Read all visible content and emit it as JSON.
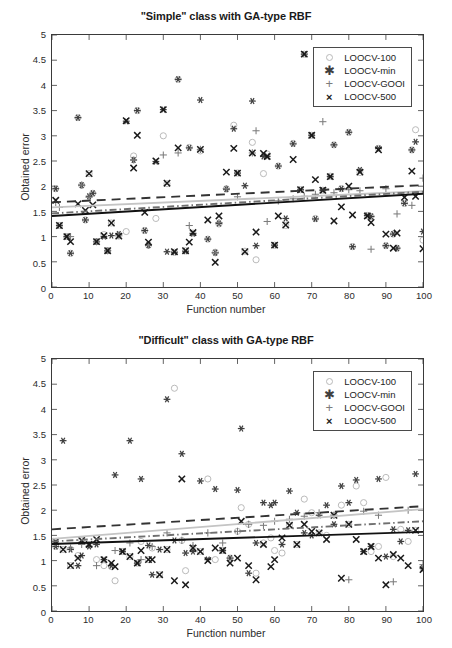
{
  "figure": {
    "background": "#ffffff",
    "width": 452,
    "height": 648
  },
  "axis_common": {
    "xlabel": "Function number",
    "ylabel": "Obtained error",
    "xticks": [
      "0",
      "10",
      "20",
      "30",
      "40",
      "50",
      "60",
      "70",
      "80",
      "90",
      "100"
    ],
    "yticks": [
      "0",
      "0.5",
      "1",
      "1.5",
      "2",
      "2.5",
      "3",
      "3.5",
      "4",
      "4.5",
      "5"
    ],
    "xlim": [
      0,
      100
    ],
    "ylim": [
      0,
      5
    ],
    "grid": false
  },
  "legend": {
    "position": "top-right",
    "entries": [
      {
        "label": "LOOCV-100",
        "marker": "circle-icon",
        "color": "#b9b9b9"
      },
      {
        "label": "LOOCV-min",
        "marker": "asterisk-icon",
        "color": "#3f3f3f"
      },
      {
        "label": "LOOCV-GOOI",
        "marker": "plus-icon",
        "color": "#7c7c7c"
      },
      {
        "label": "LOOCV-500",
        "marker": "cross-icon",
        "color": "#1a1a1a"
      }
    ]
  },
  "chart_data": [
    {
      "id": "simple-class",
      "type": "scatter",
      "title": "\"Simple\" class with GA-type RBF",
      "xlabel": "Function number",
      "ylabel": "Obtained error",
      "xlim": [
        0,
        100
      ],
      "ylim": [
        0,
        5
      ],
      "grid": false,
      "legend_position": "top-right",
      "series": [
        {
          "name": "LOOCV-100",
          "marker": "circle",
          "color": "#b9b9b9",
          "x": [
            1,
            2,
            4,
            5,
            7,
            8,
            9,
            10,
            11,
            12,
            14,
            15,
            16,
            18,
            20,
            22,
            23,
            25,
            26,
            28,
            30,
            31,
            33,
            34,
            36,
            37,
            38,
            40,
            42,
            44,
            45,
            47,
            49,
            50,
            52,
            54,
            55,
            57,
            58,
            60,
            61,
            63,
            65,
            67,
            68,
            70,
            71,
            73,
            75,
            76,
            78,
            80,
            81,
            83,
            85,
            86,
            88,
            90,
            92,
            93,
            95,
            97,
            98,
            100
          ],
          "y": [
            1.95,
            1.22,
            1.0,
            0.67,
            3.36,
            2.02,
            1.33,
            2.25,
            1.86,
            0.9,
            1.04,
            0.72,
            1.27,
            1.01,
            1.1,
            2.6,
            3.5,
            1.12,
            0.83,
            1.36,
            3.0,
            2.05,
            0.69,
            4.12,
            0.72,
            2.77,
            1.07,
            2.7,
            0.95,
            0.69,
            1.25,
            1.95,
            3.21,
            2.26,
            0.71,
            2.87,
            0.54,
            2.25,
            2.64,
            0.83,
            2.4,
            1.22,
            2.85,
            1.93,
            4.62,
            3.01,
            1.36,
            1.92,
            2.2,
            2.82,
            1.95,
            3.07,
            0.8,
            2.27,
            1.42,
            1.4,
            2.75,
            0.82,
            1.05,
            0.77,
            1.66,
            2.72,
            3.12,
            0.93
          ]
        },
        {
          "name": "LOOCV-min",
          "marker": "asterisk",
          "color": "#3f3f3f",
          "x": [
            1,
            2,
            4,
            5,
            7,
            8,
            9,
            10,
            11,
            12,
            14,
            15,
            16,
            18,
            20,
            22,
            23,
            25,
            26,
            28,
            30,
            31,
            33,
            34,
            36,
            37,
            38,
            40,
            42,
            44,
            45,
            47,
            49,
            50,
            52,
            54,
            55,
            57,
            58,
            60,
            61,
            63,
            65,
            67,
            68,
            70,
            71,
            73,
            75,
            76,
            78,
            80,
            81,
            83,
            85,
            86,
            88,
            90,
            92,
            93,
            95,
            97,
            98,
            100
          ],
          "y": [
            1.95,
            1.22,
            1.0,
            0.67,
            3.36,
            2.02,
            1.33,
            1.8,
            1.86,
            0.9,
            1.0,
            0.72,
            1.02,
            1.05,
            3.29,
            2.52,
            3.5,
            1.12,
            0.83,
            2.49,
            3.52,
            0.7,
            0.69,
            4.12,
            0.71,
            2.76,
            1.06,
            3.71,
            0.95,
            0.68,
            1.26,
            1.94,
            3.14,
            2.26,
            2.01,
            3.69,
            0.82,
            2.59,
            2.59,
            0.83,
            2.4,
            1.36,
            2.84,
            1.93,
            4.62,
            3.01,
            1.35,
            1.92,
            2.19,
            2.82,
            1.95,
            3.07,
            0.8,
            2.32,
            1.42,
            1.4,
            2.75,
            0.82,
            1.05,
            0.77,
            1.66,
            2.72,
            2.88,
            1.1
          ]
        },
        {
          "name": "LOOCV-GOOI",
          "marker": "plus",
          "color": "#7c7c7c",
          "x": [
            1,
            2,
            5,
            8,
            10,
            12,
            15,
            18,
            22,
            26,
            30,
            34,
            37,
            40,
            44,
            45,
            47,
            50,
            54,
            55,
            58,
            61,
            65,
            68,
            71,
            73,
            76,
            80,
            83,
            86,
            90,
            93,
            97,
            100
          ],
          "y": [
            1.68,
            1.58,
            1.0,
            2.02,
            1.78,
            0.9,
            0.72,
            1.03,
            2.52,
            0.83,
            2.62,
            2.66,
            1.22,
            2.73,
            0.68,
            1.28,
            1.95,
            1.79,
            2.66,
            3.1,
            1.3,
            1.71,
            1.75,
            1.8,
            1.84,
            3.28,
            1.87,
            1.93,
            1.91,
            0.75,
            1.95,
            1.45,
            1.62,
            2.16
          ]
        },
        {
          "name": "LOOCV-500",
          "marker": "cross",
          "color": "#1a1a1a",
          "x": [
            1,
            2,
            4,
            5,
            7,
            9,
            10,
            11,
            12,
            14,
            15,
            16,
            18,
            20,
            22,
            23,
            25,
            26,
            28,
            30,
            31,
            33,
            34,
            36,
            37,
            38,
            40,
            42,
            44,
            45,
            47,
            49,
            50,
            52,
            54,
            55,
            57,
            58,
            60,
            61,
            63,
            65,
            67,
            68,
            70,
            71,
            73,
            75,
            76,
            78,
            80,
            81,
            83,
            85,
            86,
            88,
            90,
            92,
            93,
            95,
            97,
            98,
            100
          ],
          "y": [
            1.72,
            1.22,
            1.0,
            0.9,
            1.65,
            1.52,
            2.25,
            1.63,
            0.9,
            1.02,
            0.72,
            1.27,
            1.01,
            3.3,
            2.36,
            3.01,
            1.48,
            0.89,
            2.5,
            3.52,
            2.06,
            0.7,
            2.76,
            0.72,
            0.89,
            1.08,
            2.73,
            1.33,
            0.49,
            1.41,
            2.28,
            2.75,
            2.26,
            0.7,
            2.66,
            1.09,
            2.65,
            2.59,
            0.83,
            1.41,
            1.23,
            2.53,
            1.93,
            4.62,
            3.01,
            2.13,
            1.92,
            2.19,
            1.31,
            1.59,
            2.0,
            1.43,
            2.28,
            1.41,
            1.28,
            2.72,
            1.05,
            0.77,
            1.07,
            1.78,
            2.3,
            1.8,
            0.76
          ]
        }
      ],
      "trend_lines": [
        {
          "name": "LOOCV-min-fit",
          "style": "dashed",
          "color": "#333333",
          "y_start": 1.68,
          "y_end": 2.02
        },
        {
          "name": "LOOCV-100-fit",
          "style": "solid",
          "color": "#c4c4c4",
          "y_start": 1.58,
          "y_end": 1.9
        },
        {
          "name": "LOOCV-GOOI-fit",
          "style": "dashdot",
          "color": "#6f6f6f",
          "y_start": 1.46,
          "y_end": 1.89
        },
        {
          "name": "LOOCV-500-fit",
          "style": "solid",
          "color": "#111111",
          "y_start": 1.41,
          "y_end": 1.85
        }
      ]
    },
    {
      "id": "difficult-class",
      "type": "scatter",
      "title": "\"Difficult\" class with GA-type RBF",
      "xlabel": "Function number",
      "ylabel": "Obtained error",
      "xlim": [
        0,
        100
      ],
      "ylim": [
        0,
        5
      ],
      "grid": false,
      "legend_position": "top-right",
      "series": [
        {
          "name": "LOOCV-100",
          "marker": "circle",
          "color": "#b9b9b9",
          "x": [
            1,
            3,
            5,
            7,
            8,
            10,
            12,
            14,
            16,
            17,
            19,
            21,
            23,
            24,
            26,
            27,
            29,
            31,
            33,
            35,
            36,
            38,
            40,
            42,
            44,
            46,
            48,
            50,
            51,
            53,
            55,
            57,
            59,
            60,
            62,
            64,
            66,
            68,
            70,
            72,
            74,
            76,
            78,
            80,
            82,
            84,
            86,
            88,
            90,
            92,
            94,
            96,
            98,
            100
          ],
          "y": [
            1.28,
            1.22,
            0.9,
            1.1,
            1.4,
            1.32,
            1.02,
            0.9,
            0.88,
            0.6,
            1.18,
            1.08,
            0.95,
            1.38,
            1.02,
            1.25,
            0.72,
            1.22,
            4.42,
            1.4,
            0.8,
            1.25,
            1.18,
            2.62,
            1.02,
            1.2,
            1.05,
            1.58,
            2.05,
            1.72,
            0.75,
            1.35,
            1.45,
            1.2,
            1.15,
            1.7,
            1.32,
            2.22,
            1.95,
            1.55,
            1.5,
            1.9,
            2.1,
            1.72,
            2.48,
            2.15,
            1.18,
            1.28,
            2.65,
            1.08,
            1.62,
            1.38,
            1.6,
            0.85
          ]
        },
        {
          "name": "LOOCV-min",
          "marker": "asterisk",
          "color": "#3f3f3f",
          "x": [
            1,
            3,
            5,
            7,
            8,
            10,
            12,
            14,
            16,
            17,
            19,
            21,
            23,
            24,
            26,
            27,
            29,
            31,
            33,
            35,
            36,
            38,
            40,
            42,
            44,
            46,
            48,
            50,
            51,
            53,
            55,
            57,
            59,
            60,
            62,
            64,
            66,
            68,
            70,
            72,
            74,
            76,
            78,
            80,
            82,
            84,
            86,
            88,
            90,
            92,
            94,
            96,
            98,
            100
          ],
          "y": [
            1.28,
            3.38,
            1.22,
            0.9,
            1.1,
            1.28,
            1.32,
            1.02,
            0.9,
            2.7,
            1.18,
            3.38,
            0.95,
            2.62,
            1.3,
            0.72,
            1.22,
            4.2,
            1.4,
            3.12,
            1.15,
            1.18,
            2.58,
            1.02,
            2.42,
            1.2,
            1.05,
            2.4,
            3.62,
            0.75,
            1.35,
            2.15,
            2.1,
            2.15,
            1.32,
            2.38,
            1.95,
            1.55,
            1.5,
            1.9,
            2.1,
            1.72,
            2.48,
            2.15,
            2.6,
            1.18,
            1.28,
            2.62,
            1.08,
            1.62,
            1.38,
            1.6,
            2.72,
            0.85
          ]
        },
        {
          "name": "LOOCV-GOOI",
          "marker": "plus",
          "color": "#7c7c7c",
          "x": [
            1,
            5,
            8,
            12,
            17,
            21,
            24,
            27,
            31,
            35,
            38,
            42,
            46,
            50,
            53,
            57,
            60,
            64,
            68,
            72,
            76,
            80,
            84,
            88,
            92,
            96,
            100
          ],
          "y": [
            1.35,
            1.25,
            1.32,
            0.9,
            1.2,
            1.35,
            1.02,
            1.28,
            1.55,
            1.4,
            1.3,
            1.55,
            1.35,
            1.58,
            1.72,
            1.7,
            1.78,
            1.82,
            1.88,
            1.95,
            1.9,
            0.62,
            1.98,
            1.9,
            0.58,
            2.0,
            0.92
          ]
        },
        {
          "name": "LOOCV-500",
          "marker": "cross",
          "color": "#1a1a1a",
          "x": [
            1,
            3,
            5,
            7,
            8,
            10,
            12,
            14,
            16,
            17,
            19,
            21,
            23,
            24,
            26,
            27,
            29,
            31,
            33,
            35,
            36,
            38,
            40,
            42,
            44,
            46,
            48,
            50,
            51,
            53,
            55,
            57,
            59,
            60,
            62,
            64,
            66,
            68,
            70,
            72,
            74,
            76,
            78,
            80,
            82,
            84,
            86,
            88,
            90,
            92,
            94,
            96,
            98,
            100
          ],
          "y": [
            1.38,
            1.22,
            0.9,
            1.05,
            1.4,
            1.32,
            1.42,
            1.02,
            0.95,
            0.88,
            1.18,
            1.08,
            0.95,
            1.2,
            1.02,
            1.02,
            0.72,
            1.22,
            0.6,
            2.62,
            0.52,
            1.25,
            1.18,
            1.0,
            1.25,
            1.2,
            0.95,
            1.05,
            1.78,
            0.9,
            0.62,
            1.32,
            0.88,
            1.02,
            1.45,
            1.7,
            1.32,
            1.72,
            1.58,
            1.55,
            1.42,
            1.9,
            0.65,
            1.72,
            1.42,
            1.18,
            1.28,
            1.05,
            0.52,
            1.12,
            1.05,
            0.9,
            1.6,
            0.82
          ]
        }
      ],
      "trend_lines": [
        {
          "name": "LOOCV-min-fit",
          "style": "dashed",
          "color": "#333333",
          "y_start": 1.62,
          "y_end": 2.08
        },
        {
          "name": "LOOCV-100-fit",
          "style": "solid",
          "color": "#c4c4c4",
          "y_start": 1.43,
          "y_end": 2.02
        },
        {
          "name": "LOOCV-GOOI-fit",
          "style": "dashdot",
          "color": "#6f6f6f",
          "y_start": 1.38,
          "y_end": 1.78
        },
        {
          "name": "LOOCV-500-fit",
          "style": "solid",
          "color": "#111111",
          "y_start": 1.33,
          "y_end": 1.57
        }
      ]
    }
  ]
}
